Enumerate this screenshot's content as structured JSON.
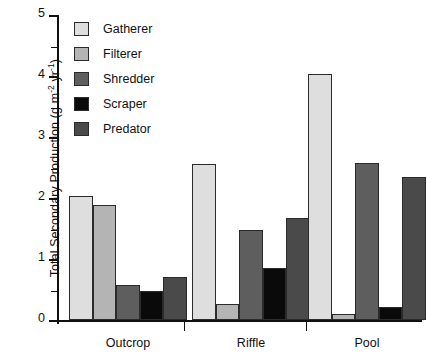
{
  "chart_data": {
    "type": "bar",
    "title": "",
    "xlabel": "",
    "ylabel": "Total Secondary Production (g m-2 yr-1)",
    "ylabel_parts": {
      "prefix": "Total Secondary Production (g m",
      "exp1": "-2",
      "mid": " yr",
      "exp2": "-1",
      "suffix": ")"
    },
    "categories": [
      "Outcrop",
      "Riffle",
      "Pool"
    ],
    "series": [
      {
        "name": "Gatherer",
        "color": "#dedede",
        "values": [
          2.04,
          2.55,
          4.03
        ]
      },
      {
        "name": "Filterer",
        "color": "#b4b4b4",
        "values": [
          1.88,
          0.27,
          0.1
        ]
      },
      {
        "name": "Shredder",
        "color": "#5e5e5e",
        "values": [
          0.57,
          1.48,
          2.58
        ]
      },
      {
        "name": "Scraper",
        "color": "#0a0a0a",
        "values": [
          0.48,
          0.85,
          0.21
        ]
      },
      {
        "name": "Predator",
        "color": "#4a4a4a",
        "values": [
          0.7,
          1.68,
          2.35
        ]
      }
    ],
    "ylim": [
      0,
      5
    ],
    "yticks": [
      0,
      1,
      2,
      3,
      4,
      5
    ],
    "ytick_labels": [
      "0",
      "1",
      "2",
      "3",
      "4",
      "5"
    ],
    "yminor_ticks": [
      0.5,
      1.5,
      2.5,
      3.5,
      4.5
    ],
    "grid": false,
    "legend_position": "upper-left-inside",
    "legend_entries": [
      "Gatherer",
      "Filterer",
      "Shredder",
      "Scraper",
      "Predator"
    ]
  }
}
